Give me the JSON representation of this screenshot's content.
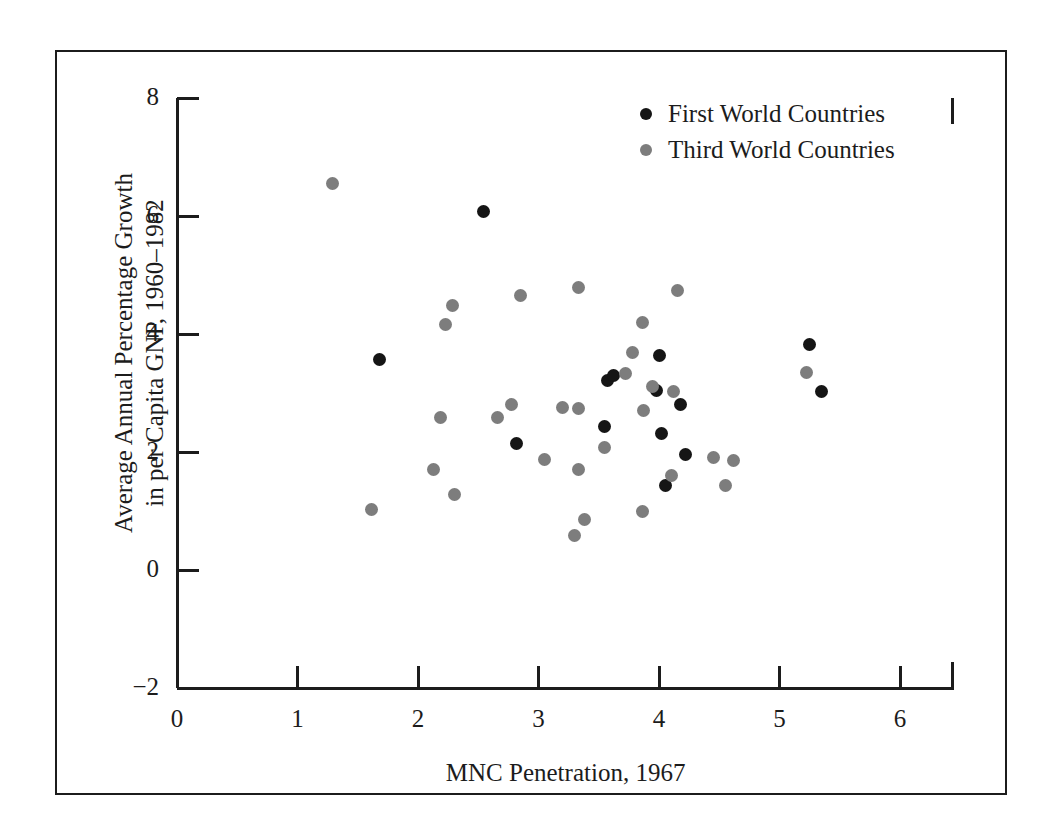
{
  "figure": {
    "background": "#ffffff",
    "ink_color": "#1c1c1c",
    "frame": {
      "left": 55,
      "top": 50,
      "width": 952,
      "height": 745
    }
  },
  "chart_data": {
    "type": "scatter",
    "title": "",
    "xlabel": "MNC Penetration, 1967",
    "ylabel": "Average Annual Percentage Growth in per Capita GNP, 1960–1982",
    "ylabel_line1": "Average Annual Percentage Growth",
    "ylabel_line2": "in per Capita GNP, 1960–1982",
    "xlim": [
      0,
      6.45
    ],
    "ylim": [
      -2,
      8
    ],
    "xticks": [
      0,
      1,
      2,
      3,
      4,
      5,
      6
    ],
    "xtick_labels": [
      "0",
      "1",
      "2",
      "3",
      "4",
      "5",
      "6"
    ],
    "yticks": [
      -2,
      0,
      2,
      4,
      6,
      8
    ],
    "ytick_labels": [
      "−2",
      "0",
      "2",
      "4",
      "6",
      "8"
    ],
    "grid": false,
    "legend_position": "top-right",
    "series": [
      {
        "name": "First World Countries",
        "key": "first",
        "color": "#151515",
        "points": [
          [
            2.54,
            6.07
          ],
          [
            1.68,
            3.56
          ],
          [
            5.25,
            3.83
          ],
          [
            5.35,
            3.03
          ],
          [
            3.57,
            3.22
          ],
          [
            3.62,
            3.3
          ],
          [
            4.0,
            3.64
          ],
          [
            3.98,
            3.04
          ],
          [
            4.18,
            2.81
          ],
          [
            3.55,
            2.44
          ],
          [
            2.82,
            2.14
          ],
          [
            4.02,
            2.32
          ],
          [
            4.22,
            1.95
          ],
          [
            4.05,
            1.43
          ]
        ]
      },
      {
        "name": "Third World Countries",
        "key": "third",
        "color": "#7d7d7d",
        "points": [
          [
            1.29,
            6.55
          ],
          [
            4.15,
            4.73
          ],
          [
            3.33,
            4.79
          ],
          [
            2.85,
            4.66
          ],
          [
            2.29,
            4.48
          ],
          [
            2.23,
            4.16
          ],
          [
            3.86,
            4.2
          ],
          [
            3.78,
            3.68
          ],
          [
            5.22,
            3.35
          ],
          [
            3.72,
            3.33
          ],
          [
            3.95,
            3.11
          ],
          [
            4.12,
            3.02
          ],
          [
            3.87,
            2.7
          ],
          [
            2.78,
            2.8
          ],
          [
            3.2,
            2.76
          ],
          [
            3.33,
            2.74
          ],
          [
            2.66,
            2.59
          ],
          [
            2.19,
            2.58
          ],
          [
            3.05,
            1.87
          ],
          [
            3.33,
            1.7
          ],
          [
            3.55,
            2.07
          ],
          [
            4.1,
            1.6
          ],
          [
            4.45,
            1.9
          ],
          [
            4.62,
            1.86
          ],
          [
            4.55,
            1.43
          ],
          [
            2.13,
            1.71
          ],
          [
            2.3,
            1.28
          ],
          [
            1.61,
            1.03
          ],
          [
            3.38,
            0.86
          ],
          [
            3.86,
            1.0
          ],
          [
            3.3,
            0.58
          ]
        ]
      }
    ]
  },
  "legend": {
    "items": [
      {
        "label": "First World Countries",
        "key": "first"
      },
      {
        "label": "Third World Countries",
        "key": "third"
      }
    ]
  }
}
